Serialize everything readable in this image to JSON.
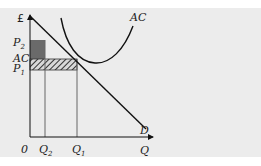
{
  "diagram": {
    "type": "economics-cost-demand",
    "background_color": "#ececec",
    "axes": {
      "y_label": "£",
      "x_label": "Q",
      "origin_label": "0"
    },
    "price_labels": {
      "p2": {
        "base": "P",
        "sub": "2"
      },
      "ac": "AC",
      "p1": {
        "base": "P",
        "sub": "1"
      }
    },
    "quantity_labels": {
      "q2": {
        "base": "Q",
        "sub": "2"
      },
      "q1": {
        "base": "Q",
        "sub": "1"
      }
    },
    "curves": {
      "ac_label": "AC",
      "demand_label": "D"
    },
    "regions": {
      "dark_box_color": "#6a6a6a",
      "hatched_box_fill": "hatched"
    }
  }
}
